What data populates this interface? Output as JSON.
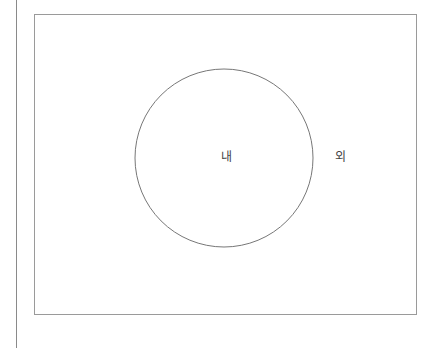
{
  "diagram": {
    "type": "venn-single-set",
    "frame": {
      "x": 34,
      "y": 14,
      "width": 382,
      "height": 300,
      "stroke": "#9a9a9a"
    },
    "circle": {
      "cx": 224,
      "cy": 158,
      "r": 89,
      "stroke": "#777777"
    },
    "labels": {
      "inside": "내",
      "outside": "외"
    }
  }
}
